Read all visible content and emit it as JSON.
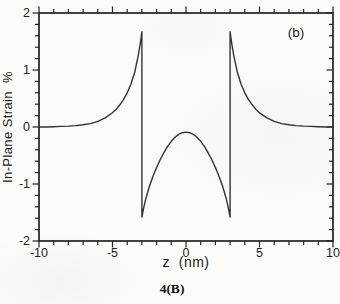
{
  "figure": {
    "panel_label": "(b)",
    "caption": "4(B)",
    "xlabel": "z  (nm)",
    "ylabel": "In-Plane Strain  %"
  },
  "colors": {
    "ink": "#222222",
    "curve": "#333333",
    "paper": "#fbfbf9"
  },
  "chart_data": {
    "type": "line",
    "title": "",
    "xlabel": "z (nm)",
    "ylabel": "In-Plane Strain %",
    "xlim": [
      -10,
      10
    ],
    "ylim": [
      -2,
      2
    ],
    "x_major_ticks": [
      -10,
      -5,
      0,
      5,
      10
    ],
    "x_tick_labels": [
      "-10",
      "-5",
      "0",
      "5",
      "10"
    ],
    "x_minor_step": 1,
    "y_major_ticks": [
      2,
      1,
      0,
      -1,
      -2
    ],
    "y_tick_labels": [
      "2",
      "1",
      "0",
      "-1",
      "-2"
    ],
    "y_minor_step": 0.2,
    "grid": false,
    "legend": "none",
    "annotations": [
      {
        "text": "(b)",
        "x": 7.5,
        "y": 1.65
      }
    ],
    "series": [
      {
        "name": "in-plane strain",
        "points": [
          [
            -10,
            0
          ],
          [
            -9.5,
            0
          ],
          [
            -9,
            0.005
          ],
          [
            -8.5,
            0.01
          ],
          [
            -8,
            0.015
          ],
          [
            -7.5,
            0.025
          ],
          [
            -7,
            0.04
          ],
          [
            -6.5,
            0.06
          ],
          [
            -6,
            0.1
          ],
          [
            -5.5,
            0.16
          ],
          [
            -5,
            0.25
          ],
          [
            -4.75,
            0.31
          ],
          [
            -4.5,
            0.39
          ],
          [
            -4.25,
            0.48
          ],
          [
            -4,
            0.6
          ],
          [
            -3.75,
            0.75
          ],
          [
            -3.5,
            0.95
          ],
          [
            -3.25,
            1.25
          ],
          [
            -3.1,
            1.48
          ],
          [
            -3,
            1.67
          ],
          [
            -3,
            -1.58
          ],
          [
            -2.9,
            -1.44
          ],
          [
            -2.75,
            -1.27
          ],
          [
            -2.5,
            -1.05
          ],
          [
            -2.25,
            -0.87
          ],
          [
            -2,
            -0.71
          ],
          [
            -1.75,
            -0.57
          ],
          [
            -1.5,
            -0.45
          ],
          [
            -1.25,
            -0.34
          ],
          [
            -1,
            -0.25
          ],
          [
            -0.75,
            -0.18
          ],
          [
            -0.5,
            -0.13
          ],
          [
            -0.25,
            -0.1
          ],
          [
            0,
            -0.09
          ],
          [
            0.25,
            -0.1
          ],
          [
            0.5,
            -0.13
          ],
          [
            0.75,
            -0.18
          ],
          [
            1,
            -0.25
          ],
          [
            1.25,
            -0.34
          ],
          [
            1.5,
            -0.45
          ],
          [
            1.75,
            -0.57
          ],
          [
            2,
            -0.71
          ],
          [
            2.25,
            -0.87
          ],
          [
            2.5,
            -1.05
          ],
          [
            2.75,
            -1.27
          ],
          [
            2.9,
            -1.44
          ],
          [
            3,
            -1.58
          ],
          [
            3,
            1.67
          ],
          [
            3.1,
            1.48
          ],
          [
            3.25,
            1.25
          ],
          [
            3.5,
            0.95
          ],
          [
            3.75,
            0.75
          ],
          [
            4,
            0.6
          ],
          [
            4.25,
            0.48
          ],
          [
            4.5,
            0.39
          ],
          [
            4.75,
            0.31
          ],
          [
            5,
            0.25
          ],
          [
            5.5,
            0.16
          ],
          [
            6,
            0.1
          ],
          [
            6.5,
            0.06
          ],
          [
            7,
            0.04
          ],
          [
            7.5,
            0.025
          ],
          [
            8,
            0.015
          ],
          [
            8.5,
            0.01
          ],
          [
            9,
            0.005
          ],
          [
            9.5,
            0
          ],
          [
            10,
            0
          ]
        ]
      }
    ]
  }
}
